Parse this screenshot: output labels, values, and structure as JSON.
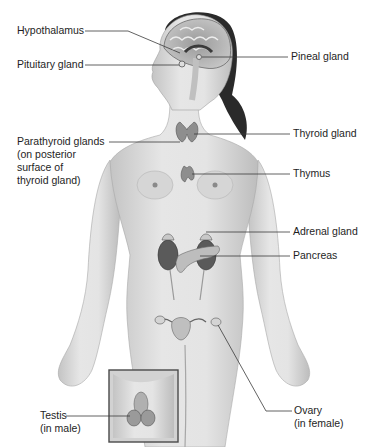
{
  "diagram": {
    "labels": {
      "hypothalamus": "Hypothalamus",
      "pituitary": "Pituitary gland",
      "pineal": "Pineal gland",
      "parathyroid": [
        "Parathyroid glands",
        "(on posterior",
        "surface of",
        "thyroid gland)"
      ],
      "thyroid": "Thyroid gland",
      "thymus": "Thymus",
      "adrenal": "Adrenal gland",
      "pancreas": "Pancreas",
      "testis": [
        "Testis",
        "(in male)"
      ],
      "ovary": [
        "Ovary",
        "(in female)"
      ]
    },
    "colors": {
      "background": "#ffffff",
      "skin": "#dcdcdc",
      "skin_shadow": "#b8b8b8",
      "hair": "#2a2a2a",
      "organ": "#8a8a8a",
      "kidney": "#5a5a5a",
      "leader_line": "#3a3a3a",
      "inset_border": "#4a4a4a"
    }
  }
}
